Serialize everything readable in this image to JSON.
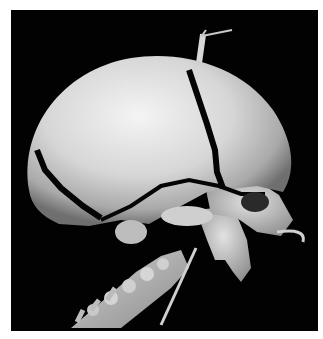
{
  "image": {
    "subject": "3D CT volume rendering of infant skull, lateral oblique view",
    "background_color": "#020202",
    "border_color": "#ffffff",
    "bone_color": "#d9d9d9",
    "structures": [
      "parietal-bone",
      "frontal-bone",
      "occipital-bone",
      "coronal-suture",
      "lambdoid-suture",
      "squamosal-suture",
      "orbit",
      "maxilla",
      "mandible",
      "cervical-spine",
      "scalp-tube",
      "oral-tube",
      "neck-tube"
    ]
  }
}
